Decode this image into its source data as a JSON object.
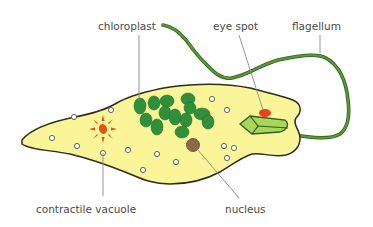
{
  "labels": {
    "chloroplast": "chloroplast",
    "eye_spot": "eye spot",
    "flagellum": "flagellum",
    "contractile_vacuole": "contractile vacuole",
    "nucleus": "nucleus"
  },
  "colors": {
    "cytoplasm": "#fbf59a",
    "outline": "#2d2d1a",
    "chloroplast": "#2f8f3a",
    "flagellum": "#4a8a2e",
    "eye_spot": "#e8401c",
    "nucleus": "#8b6a45",
    "vacuole": "#e8501c",
    "reservoir": "#a8d65a"
  }
}
